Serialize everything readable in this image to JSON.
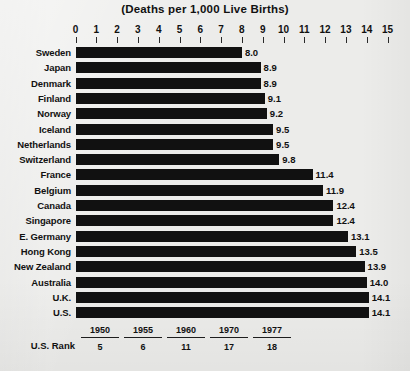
{
  "chart_data": {
    "type": "bar",
    "orientation": "horizontal",
    "title": "(Deaths per 1,000 Live Births)",
    "xlabel": "",
    "ylabel": "",
    "xlim": [
      0,
      15
    ],
    "grid": false,
    "legend": null,
    "tick_labels": [
      "0",
      "1",
      "2",
      "3",
      "4",
      "5",
      "6",
      "7",
      "8",
      "9",
      "10",
      "11",
      "12",
      "13",
      "14",
      "15"
    ],
    "categories": [
      "Sweden",
      "Japan",
      "Denmark",
      "Finland",
      "Norway",
      "Iceland",
      "Netherlands",
      "Switzerland",
      "France",
      "Belgium",
      "Canada",
      "Singapore",
      "E. Germany",
      "Hong Kong",
      "New Zealand",
      "Australia",
      "U.K.",
      "U.S."
    ],
    "values": [
      8.0,
      8.9,
      8.9,
      9.1,
      9.2,
      9.5,
      9.5,
      9.8,
      11.4,
      11.9,
      12.4,
      12.4,
      13.1,
      13.5,
      13.9,
      14.0,
      14.1,
      14.1
    ],
    "value_labels": [
      "8.0",
      "8.9",
      "8.9",
      "9.1",
      "9.2",
      "9.5",
      "9.5",
      "9.8",
      "11.4",
      "11.9",
      "12.4",
      "12.4",
      "13.1",
      "13.5",
      "13.9",
      "14.0",
      "14.1",
      "14.1"
    ],
    "bar_color": "#111111",
    "background_color": "#ececea"
  },
  "rank_table": {
    "row_label": "U.S. Rank",
    "years": [
      "1950",
      "1955",
      "1960",
      "1970",
      "1977"
    ],
    "ranks": [
      "5",
      "6",
      "11",
      "17",
      "18"
    ]
  }
}
